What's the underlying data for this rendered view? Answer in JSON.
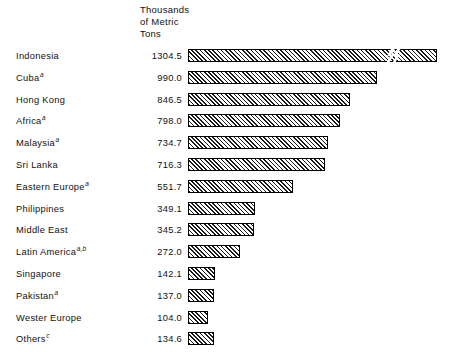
{
  "chart_data": {
    "type": "bar",
    "title": "",
    "subtitle": "",
    "xlabel": "",
    "ylabel": "",
    "value_header": "Thousands\nof Metric\nTons",
    "orientation": "horizontal",
    "grid": false,
    "legend": "none",
    "axis_break": {
      "present": true,
      "on_category": "Indonesia",
      "symbol": "zigzag-break",
      "note": "first bar drawn with a scale break"
    },
    "categories": [
      "Indonesia",
      "Cuba",
      "Hong Kong",
      "Africa",
      "Malaysia",
      "Sri Lanka",
      "Eastern Europe",
      "Philippines",
      "Middle East",
      "Latin America",
      "Singapore",
      "Pakistan",
      "Wester Europe",
      "Others"
    ],
    "category_footnotes": [
      "",
      "a",
      "",
      "a",
      "a",
      "",
      "a",
      "",
      "",
      "a,b",
      "",
      "a",
      "",
      "c"
    ],
    "values": [
      1304.5,
      990.0,
      846.5,
      798.0,
      734.7,
      716.3,
      551.7,
      349.1,
      345.2,
      272.0,
      142.1,
      137.0,
      104.0,
      134.6
    ],
    "value_labels": [
      "1304.5",
      "990.0",
      "846.5",
      "798.0",
      "734.7",
      "716.3",
      "551.7",
      "349.1",
      "345.2",
      "272.0",
      "142.1",
      "137.0",
      "104.0",
      "134.6"
    ],
    "xlim": [
      0,
      1304.5
    ],
    "bar_style": {
      "fill": "diagonal-hatch",
      "hatch_color": "#1a1a1a",
      "background": "#ffffff",
      "outline": "#000000"
    }
  },
  "colors": {
    "page_background": "#ffffff",
    "text": "#111111",
    "bar_outline": "#000000",
    "bar_hatch": "#1a1a1a"
  }
}
